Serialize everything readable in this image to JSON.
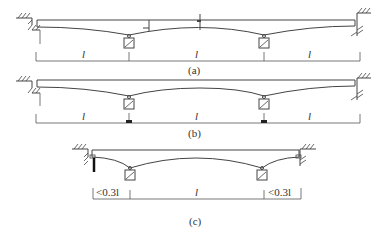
{
  "figure": {
    "panels": [
      {
        "id": "a",
        "caption": "(a)",
        "spans": [
          {
            "label": "l"
          },
          {
            "label": "l"
          },
          {
            "label": "l"
          }
        ]
      },
      {
        "id": "b",
        "caption": "(b)",
        "spans": [
          {
            "label": "l"
          },
          {
            "label": "l"
          },
          {
            "label": "l"
          }
        ]
      },
      {
        "id": "c",
        "caption": "(c)",
        "spans": [
          {
            "label": "<0.3l"
          },
          {
            "label": "l"
          },
          {
            "label": "<0.3l"
          }
        ]
      }
    ]
  },
  "colors": {
    "line": "#444444",
    "background": "#ffffff"
  }
}
